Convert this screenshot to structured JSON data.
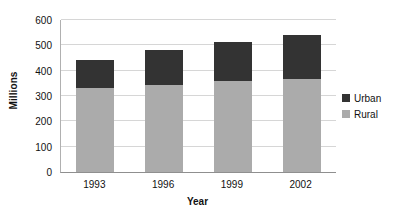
{
  "chart_data": {
    "type": "bar",
    "subtype": "stacked-column",
    "title": "",
    "xlabel": "Year",
    "ylabel": "Millions",
    "categories": [
      "1993",
      "1996",
      "1999",
      "2002"
    ],
    "series": [
      {
        "name": "Rural",
        "color": "#ababab",
        "values": [
          330,
          345,
          360,
          368
        ]
      },
      {
        "name": "Urban",
        "color": "#333333",
        "values": [
          113,
          135,
          155,
          172
        ]
      }
    ],
    "totals": [
      443,
      480,
      515,
      540
    ],
    "stack_order_bottom_to_top": [
      "Rural",
      "Urban"
    ],
    "ylim": [
      0,
      600
    ],
    "yticks": [
      0,
      100,
      200,
      300,
      400,
      500,
      600
    ],
    "ytick_labels": [
      "0",
      "100",
      "200",
      "300",
      "400",
      "500",
      "600"
    ],
    "grid": {
      "horizontal": true,
      "vertical": false
    },
    "legend": {
      "position": "right",
      "entries": [
        {
          "label": "Urban",
          "color": "#333333"
        },
        {
          "label": "Rural",
          "color": "#ababab"
        }
      ]
    }
  },
  "colors": {
    "urban": "#333333",
    "rural": "#ababab",
    "gridline": "#d6d6d6",
    "axis": "#8f8f8f",
    "background": "#ffffff",
    "text": "#111111"
  }
}
